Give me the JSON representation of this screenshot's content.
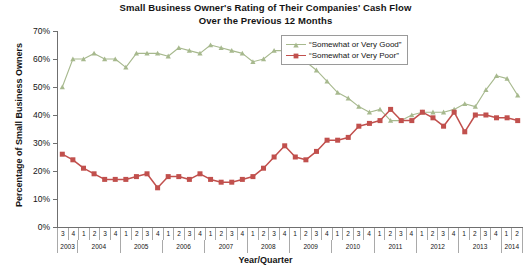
{
  "chart_data": {
    "type": "line",
    "title": "Small Business Owner's Rating of Their Companies' Cash Flow Over the Previous 12 Months",
    "title_line1": "Small Business Owner's Rating of Their Companies' Cash Flow",
    "title_line2": "Over the Previous 12 Months",
    "xlabel": "Year/Quarter",
    "ylabel": "Percentage of Small Business Owners",
    "ylim": [
      0,
      70
    ],
    "yticks": [
      0,
      10,
      20,
      30,
      40,
      50,
      60,
      70
    ],
    "ytick_labels": [
      "0%",
      "10%",
      "20%",
      "30%",
      "40%",
      "50%",
      "60%",
      "70%"
    ],
    "grid": false,
    "legend_position": "top-right-inside",
    "x": [
      "2003 Q3",
      "2003 Q4",
      "2004 Q1",
      "2004 Q2",
      "2004 Q3",
      "2004 Q4",
      "2005 Q1",
      "2005 Q2",
      "2005 Q3",
      "2005 Q4",
      "2006 Q1",
      "2006 Q2",
      "2006 Q3",
      "2006 Q4",
      "2007 Q1",
      "2007 Q2",
      "2007 Q3",
      "2007 Q4",
      "2008 Q1",
      "2008 Q2",
      "2008 Q3",
      "2008 Q4",
      "2009 Q1",
      "2009 Q2",
      "2009 Q3",
      "2009 Q4",
      "2010 Q1",
      "2010 Q2",
      "2010 Q3",
      "2010 Q4",
      "2011 Q1",
      "2011 Q2",
      "2011 Q3",
      "2011 Q4",
      "2012 Q1",
      "2012 Q2",
      "2012 Q3",
      "2012 Q4",
      "2013 Q1",
      "2013 Q2",
      "2013 Q3",
      "2013 Q4",
      "2014 Q1",
      "2014 Q2"
    ],
    "categories": [
      "3",
      "4",
      "1",
      "2",
      "3",
      "4",
      "1",
      "2",
      "3",
      "4",
      "1",
      "2",
      "3",
      "4",
      "1",
      "2",
      "3",
      "4",
      "1",
      "2",
      "3",
      "4",
      "1",
      "2",
      "3",
      "4",
      "1",
      "2",
      "3",
      "4",
      "1",
      "2",
      "3",
      "4",
      "1",
      "2",
      "3",
      "4",
      "1",
      "2",
      "3",
      "4",
      "1",
      "2"
    ],
    "year_groups": [
      {
        "year": "2003",
        "quarters": [
          "3",
          "4"
        ]
      },
      {
        "year": "2004",
        "quarters": [
          "1",
          "2",
          "3",
          "4"
        ]
      },
      {
        "year": "2005",
        "quarters": [
          "1",
          "2",
          "3",
          "4"
        ]
      },
      {
        "year": "2006",
        "quarters": [
          "1",
          "2",
          "3",
          "4"
        ]
      },
      {
        "year": "2007",
        "quarters": [
          "1",
          "2",
          "3",
          "4"
        ]
      },
      {
        "year": "2008",
        "quarters": [
          "1",
          "2",
          "3",
          "4"
        ]
      },
      {
        "year": "2009",
        "quarters": [
          "1",
          "2",
          "3",
          "4"
        ]
      },
      {
        "year": "2010",
        "quarters": [
          "1",
          "2",
          "3",
          "4"
        ]
      },
      {
        "year": "2011",
        "quarters": [
          "1",
          "2",
          "3",
          "4"
        ]
      },
      {
        "year": "2012",
        "quarters": [
          "1",
          "2",
          "3",
          "4"
        ]
      },
      {
        "year": "2013",
        "quarters": [
          "1",
          "2",
          "3",
          "4"
        ]
      },
      {
        "year": "2014",
        "quarters": [
          "1",
          "2"
        ]
      }
    ],
    "series": [
      {
        "name": "“Somewhat or Very Good”",
        "color": "#a7b98e",
        "marker": "triangle",
        "values": [
          50,
          60,
          60,
          62,
          60,
          60,
          57,
          62,
          62,
          62,
          61,
          64,
          63,
          62,
          65,
          64,
          63,
          62,
          59,
          60,
          63,
          63,
          62,
          59,
          56,
          52,
          48,
          46,
          43,
          41,
          42,
          38,
          38,
          40,
          41,
          41,
          41,
          42,
          44,
          43,
          49,
          54,
          53,
          47
        ]
      },
      {
        "name": "“Somewhat or Very Poor”",
        "color": "#c1504d",
        "marker": "square",
        "values": [
          26,
          24,
          21,
          19,
          17,
          17,
          17,
          18,
          19,
          14,
          18,
          18,
          17,
          19,
          17,
          16,
          16,
          17,
          18,
          21,
          25,
          29,
          25,
          24,
          27,
          31,
          31,
          32,
          36,
          37,
          38,
          42,
          38,
          38,
          41,
          39,
          36,
          41,
          34,
          40,
          40,
          39,
          39,
          38
        ]
      }
    ],
    "series_extended": {
      "note": "Two interleaved quarterly series, 2003 Q3 through 2014 Q2"
    }
  },
  "legend": {
    "items": [
      {
        "label": "“Somewhat or Very Good”",
        "color": "#a7b98e",
        "marker": "triangle"
      },
      {
        "label": "“Somewhat or Very Poor”",
        "color": "#c1504d",
        "marker": "square"
      }
    ]
  },
  "colors": {
    "good": "#a7b98e",
    "poor": "#c1504d",
    "axis": "#6f6f6f",
    "text": "#141414",
    "background": "#ffffff"
  }
}
